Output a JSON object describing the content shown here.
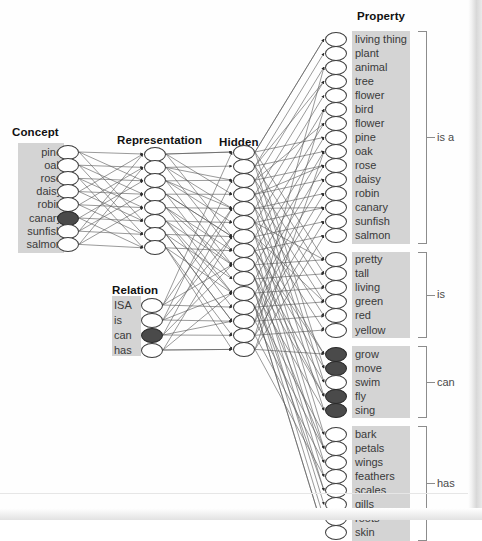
{
  "figure": {
    "title_layers": [
      {
        "label": "Concept",
        "x": 12,
        "y": 126
      },
      {
        "label": "Representation",
        "x": 117,
        "y": 134
      },
      {
        "label": "Hidden",
        "x": 219,
        "y": 136
      },
      {
        "label": "Property",
        "x": 357,
        "y": 10
      },
      {
        "label": "Relation",
        "x": 112,
        "y": 284
      }
    ],
    "concept": {
      "title": "Concept",
      "items": [
        {
          "label": "pine",
          "filled": false
        },
        {
          "label": "oak",
          "filled": false
        },
        {
          "label": "rose",
          "filled": false
        },
        {
          "label": "daisy",
          "filled": false
        },
        {
          "label": "robin",
          "filled": false
        },
        {
          "label": "canary",
          "filled": true
        },
        {
          "label": "sunfish",
          "filled": false
        },
        {
          "label": "salmon",
          "filled": false
        }
      ]
    },
    "relation": {
      "title": "Relation",
      "items": [
        {
          "label": "ISA",
          "filled": false
        },
        {
          "label": "is",
          "filled": false
        },
        {
          "label": "can",
          "filled": true
        },
        {
          "label": "has",
          "filled": false
        }
      ]
    },
    "representation": {
      "title": "Representation",
      "node_count": 8
    },
    "hidden": {
      "title": "Hidden",
      "node_count": 15
    },
    "property": {
      "title": "Property",
      "groups": [
        {
          "name": "is a",
          "items": [
            {
              "label": "living thing",
              "filled": false
            },
            {
              "label": "plant",
              "filled": false
            },
            {
              "label": "animal",
              "filled": false
            },
            {
              "label": "tree",
              "filled": false
            },
            {
              "label": "flower",
              "filled": false
            },
            {
              "label": "bird",
              "filled": false
            },
            {
              "label": "flower",
              "filled": false
            },
            {
              "label": "pine",
              "filled": false
            },
            {
              "label": "oak",
              "filled": false
            },
            {
              "label": "rose",
              "filled": false
            },
            {
              "label": "daisy",
              "filled": false
            },
            {
              "label": "robin",
              "filled": false
            },
            {
              "label": "canary",
              "filled": false
            },
            {
              "label": "sunfish",
              "filled": false
            },
            {
              "label": "salmon",
              "filled": false
            }
          ]
        },
        {
          "name": "is",
          "items": [
            {
              "label": "pretty",
              "filled": false
            },
            {
              "label": "tall",
              "filled": false
            },
            {
              "label": "living",
              "filled": false
            },
            {
              "label": "green",
              "filled": false
            },
            {
              "label": "red",
              "filled": false
            },
            {
              "label": "yellow",
              "filled": false
            }
          ]
        },
        {
          "name": "can",
          "items": [
            {
              "label": "grow",
              "filled": true
            },
            {
              "label": "move",
              "filled": true
            },
            {
              "label": "swim",
              "filled": false
            },
            {
              "label": "fly",
              "filled": true
            },
            {
              "label": "sing",
              "filled": true
            }
          ]
        },
        {
          "name": "has",
          "items": [
            {
              "label": "bark",
              "filled": false
            },
            {
              "label": "petals",
              "filled": false
            },
            {
              "label": "wings",
              "filled": false
            },
            {
              "label": "feathers",
              "filled": false
            },
            {
              "label": "scales",
              "filled": false
            },
            {
              "label": "gills",
              "filled": false
            },
            {
              "label": "roots",
              "filled": false
            },
            {
              "label": "skin",
              "filled": false
            }
          ]
        }
      ]
    },
    "colors": {
      "node_fill_active": "#4a4a4a",
      "node_fill_inactive": "#ffffff",
      "node_stroke": "#3d3d3d",
      "label_box": "#d4d4d4",
      "wire": "#555555",
      "bracket": "#8c8c8c",
      "text": "#3a3a3a"
    }
  }
}
